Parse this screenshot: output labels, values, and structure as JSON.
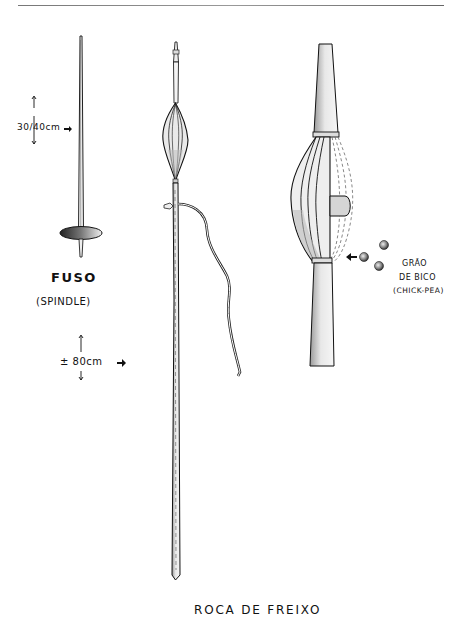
{
  "illustration": {
    "caption": "ROCA DE FREIXO",
    "spindle": {
      "title": "FUSO",
      "subtitle": "(SPINDLE)",
      "size_label": "30/40cm"
    },
    "distaff": {
      "size_label": "± 80cm"
    },
    "detail": {
      "label_line1": "GRÃO",
      "label_line2": "DE BICO",
      "label_line3": "(CHICK-PEA)"
    }
  }
}
